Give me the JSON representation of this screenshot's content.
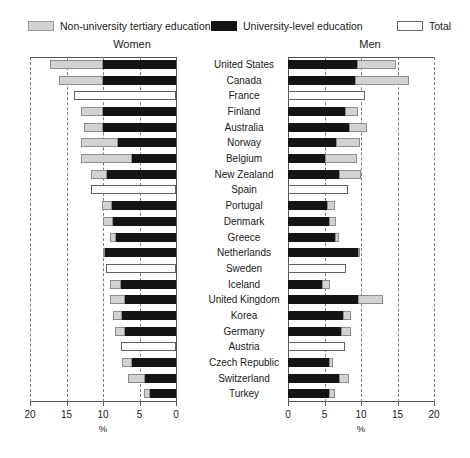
{
  "legend": {
    "items": [
      {
        "label": "Non-university tertiary education",
        "swatch": "nonuni",
        "color": "#d3d3d3"
      },
      {
        "label": "University-level education",
        "swatch": "uni",
        "color": "#141414"
      },
      {
        "label": "Total",
        "swatch": "total",
        "color": "#ffffff"
      }
    ]
  },
  "panels": {
    "left_title": "Women",
    "right_title": "Men"
  },
  "axis": {
    "left_ticks": [
      "20",
      "15",
      "10",
      "5",
      "0"
    ],
    "right_ticks": [
      "0",
      "5",
      "10",
      "15",
      "20"
    ],
    "unit_left": "%",
    "unit_right": "%"
  },
  "chart_data": {
    "type": "bar",
    "title": "",
    "subtitle": "",
    "orientation": "horizontal-diverging",
    "xlabel": "%",
    "ylabel": "",
    "xlim": [
      0,
      20
    ],
    "grid": true,
    "gridlines": [
      0,
      5,
      10,
      15,
      20
    ],
    "legend_position": "top",
    "panels": [
      "Women",
      "Men"
    ],
    "series": [
      {
        "name": "Non-university tertiary education",
        "color": "#d3d3d3"
      },
      {
        "name": "University-level education",
        "color": "#141414"
      },
      {
        "name": "Total",
        "color": "#ffffff"
      }
    ],
    "categories": [
      "United States",
      "Canada",
      "France",
      "Finland",
      "Australia",
      "Norway",
      "Belgium",
      "New Zealand",
      "Spain",
      "Portugal",
      "Denmark",
      "Greece",
      "Netherlands",
      "Sweden",
      "Iceland",
      "United Kingdom",
      "Korea",
      "Germany",
      "Austria",
      "Czech Republic",
      "Switzerland",
      "Turkey"
    ],
    "women": {
      "non_university": [
        7.2,
        6.0,
        null,
        3.0,
        2.6,
        5.0,
        7.0,
        2.2,
        null,
        1.4,
        1.4,
        0.8,
        0.0,
        null,
        1.4,
        2.1,
        1.2,
        1.4,
        null,
        1.4,
        2.4,
        0.8
      ],
      "university": [
        10.0,
        10.0,
        null,
        10.0,
        10.0,
        8.0,
        6.0,
        9.5,
        null,
        8.8,
        8.6,
        8.2,
        10.0,
        null,
        7.6,
        7.0,
        7.4,
        7.0,
        null,
        6.0,
        4.2,
        3.6
      ],
      "total": [
        17.2,
        16.0,
        14.0,
        13.0,
        12.6,
        13.0,
        13.0,
        11.7,
        11.6,
        10.2,
        10.0,
        9.0,
        10.0,
        9.6,
        9.0,
        9.1,
        8.6,
        8.4,
        7.6,
        7.4,
        6.6,
        4.4
      ]
    },
    "men": {
      "university": [
        9.4,
        9.2,
        null,
        7.8,
        8.4,
        6.6,
        5.0,
        7.0,
        null,
        5.4,
        5.6,
        6.4,
        9.6,
        null,
        4.6,
        9.6,
        7.6,
        7.2,
        null,
        5.6,
        7.0,
        5.6
      ],
      "non_university": [
        5.4,
        7.4,
        null,
        1.8,
        2.4,
        3.2,
        4.4,
        3.0,
        null,
        1.0,
        1.0,
        0.6,
        0.0,
        null,
        1.2,
        3.4,
        1.0,
        1.4,
        null,
        0.6,
        1.4,
        0.8
      ],
      "total": [
        14.8,
        16.6,
        10.6,
        9.6,
        10.8,
        9.8,
        9.4,
        10.0,
        8.2,
        6.4,
        6.6,
        7.0,
        9.6,
        8.0,
        5.8,
        13.0,
        8.6,
        8.6,
        7.8,
        6.2,
        8.4,
        6.4
      ]
    },
    "note": "Bars for France, Spain, Sweden and Austria show Total only (no breakdown)."
  }
}
